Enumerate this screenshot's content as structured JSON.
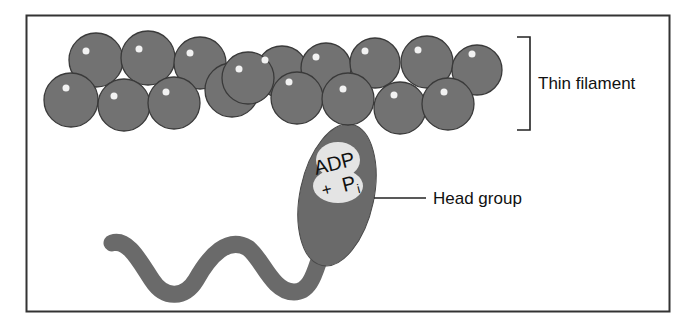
{
  "diagram": {
    "colors": {
      "sphere_fill": "#727272",
      "sphere_stroke": "#3a3a3a",
      "myosin_fill": "#6a6a6a",
      "nucleotide_pocket": "#e4e4e4",
      "border": "#333333",
      "background": "#ffffff"
    },
    "labels": {
      "thin_filament": "Thin filament",
      "head_group": "Head group",
      "adp": "ADP",
      "plus": "+",
      "pi_base": "P",
      "pi_sub": "i"
    },
    "components": [
      {
        "id": "thin-filament",
        "kind": "actin-sphere-chain"
      },
      {
        "id": "myosin-head",
        "kind": "ellipse",
        "contains": "ADP + Pi"
      },
      {
        "id": "myosin-tail",
        "kind": "wavy-tail"
      }
    ]
  }
}
